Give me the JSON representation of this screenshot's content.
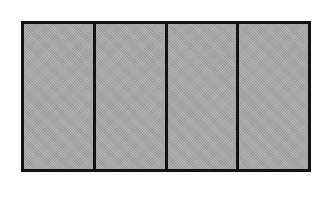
{
  "diagram": {
    "type": "fraction-rectangle",
    "total_parts": 4,
    "shaded_parts": 4,
    "fill_color": "#a9a9a9",
    "border_color": "#111111",
    "parts": [
      {
        "index": 1,
        "shaded": true
      },
      {
        "index": 2,
        "shaded": true
      },
      {
        "index": 3,
        "shaded": true
      },
      {
        "index": 4,
        "shaded": true
      }
    ]
  }
}
